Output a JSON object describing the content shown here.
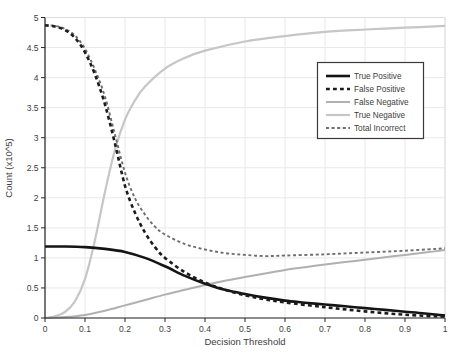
{
  "chart_data": {
    "type": "line",
    "title": "",
    "xlabel": "Decision Threshold",
    "ylabel": "Count (x10^5)",
    "xlim": [
      0,
      1
    ],
    "ylim": [
      0,
      5
    ],
    "x_ticks": [
      "0",
      "0.1",
      "0.2",
      "0.3",
      "0.4",
      "0.5",
      "0.6",
      "0.7",
      "0.8",
      "0.9",
      "1"
    ],
    "y_ticks": [
      "0",
      "0.5",
      "1",
      "1.5",
      "2",
      "2.5",
      "3",
      "3.5",
      "4",
      "4.5",
      "5"
    ],
    "grid": true,
    "legend_position": "upper-right-inset",
    "colors": {
      "axis": "#262626",
      "grid": "#e8e8e8",
      "box_light": "#dedede",
      "legend_border": "#3a3a3a",
      "background": "#ffffff"
    },
    "layout": {
      "plot": {
        "left": 45,
        "right": 445,
        "top": 17.5,
        "bottom": 318
      },
      "legend": {
        "x": 317.5,
        "y": 62.5,
        "width": 106,
        "height": 76,
        "row_start": 76,
        "row_step": 13,
        "sample_x1": 326,
        "sample_x2": 350,
        "label_x": 354
      }
    },
    "series": [
      {
        "name": "True Positive",
        "color": "#141414",
        "width": 2.6,
        "dash": null,
        "z": 4,
        "points": [
          [
            0,
            1.19
          ],
          [
            0.05,
            1.19
          ],
          [
            0.1,
            1.18
          ],
          [
            0.15,
            1.15
          ],
          [
            0.2,
            1.1
          ],
          [
            0.25,
            1.0
          ],
          [
            0.3,
            0.86
          ],
          [
            0.35,
            0.7
          ],
          [
            0.4,
            0.57
          ],
          [
            0.45,
            0.47
          ],
          [
            0.5,
            0.4
          ],
          [
            0.55,
            0.34
          ],
          [
            0.6,
            0.29
          ],
          [
            0.65,
            0.255
          ],
          [
            0.7,
            0.225
          ],
          [
            0.75,
            0.195
          ],
          [
            0.8,
            0.165
          ],
          [
            0.85,
            0.135
          ],
          [
            0.9,
            0.105
          ],
          [
            0.95,
            0.075
          ],
          [
            1,
            0.04
          ]
        ]
      },
      {
        "name": "False Positive",
        "color": "#1c1c1c",
        "width": 2.6,
        "dash": "3.8 3.2",
        "z": 5,
        "points": [
          [
            0,
            4.87
          ],
          [
            0.025,
            4.85
          ],
          [
            0.05,
            4.79
          ],
          [
            0.075,
            4.66
          ],
          [
            0.1,
            4.42
          ],
          [
            0.125,
            4.05
          ],
          [
            0.15,
            3.55
          ],
          [
            0.175,
            2.9
          ],
          [
            0.2,
            2.2
          ],
          [
            0.225,
            1.75
          ],
          [
            0.25,
            1.42
          ],
          [
            0.275,
            1.18
          ],
          [
            0.3,
            1.0
          ],
          [
            0.35,
            0.76
          ],
          [
            0.4,
            0.59
          ],
          [
            0.45,
            0.47
          ],
          [
            0.5,
            0.38
          ],
          [
            0.55,
            0.31
          ],
          [
            0.6,
            0.26
          ],
          [
            0.7,
            0.18
          ],
          [
            0.8,
            0.11
          ],
          [
            0.9,
            0.055
          ],
          [
            1,
            0.02
          ]
        ]
      },
      {
        "name": "False Negative",
        "color": "#b0b0b0",
        "width": 2,
        "dash": null,
        "z": 2,
        "points": [
          [
            0,
            0
          ],
          [
            0.05,
            0.015
          ],
          [
            0.1,
            0.05
          ],
          [
            0.15,
            0.12
          ],
          [
            0.2,
            0.21
          ],
          [
            0.25,
            0.3
          ],
          [
            0.3,
            0.39
          ],
          [
            0.35,
            0.47
          ],
          [
            0.4,
            0.55
          ],
          [
            0.45,
            0.62
          ],
          [
            0.5,
            0.68
          ],
          [
            0.55,
            0.74
          ],
          [
            0.6,
            0.8
          ],
          [
            0.65,
            0.845
          ],
          [
            0.7,
            0.89
          ],
          [
            0.75,
            0.93
          ],
          [
            0.8,
            0.97
          ],
          [
            0.85,
            1.01
          ],
          [
            0.9,
            1.05
          ],
          [
            0.95,
            1.09
          ],
          [
            1,
            1.13
          ]
        ]
      },
      {
        "name": "True Negative",
        "color": "#c6c6c6",
        "width": 2.2,
        "dash": null,
        "z": 1,
        "points": [
          [
            0,
            0
          ],
          [
            0.025,
            0.03
          ],
          [
            0.05,
            0.1
          ],
          [
            0.075,
            0.28
          ],
          [
            0.1,
            0.65
          ],
          [
            0.125,
            1.3
          ],
          [
            0.15,
            2.1
          ],
          [
            0.175,
            2.8
          ],
          [
            0.2,
            3.3
          ],
          [
            0.225,
            3.62
          ],
          [
            0.25,
            3.85
          ],
          [
            0.3,
            4.15
          ],
          [
            0.35,
            4.33
          ],
          [
            0.4,
            4.45
          ],
          [
            0.5,
            4.6
          ],
          [
            0.6,
            4.69
          ],
          [
            0.7,
            4.76
          ],
          [
            0.8,
            4.8
          ],
          [
            0.9,
            4.83
          ],
          [
            1,
            4.86
          ]
        ]
      },
      {
        "name": "Total Incorrect",
        "color": "#6e6e6e",
        "width": 1.9,
        "dash": "3 2.6",
        "z": 3,
        "points": [
          [
            0,
            4.87
          ],
          [
            0.025,
            4.86
          ],
          [
            0.05,
            4.81
          ],
          [
            0.075,
            4.7
          ],
          [
            0.1,
            4.48
          ],
          [
            0.125,
            4.13
          ],
          [
            0.15,
            3.68
          ],
          [
            0.175,
            3.05
          ],
          [
            0.2,
            2.42
          ],
          [
            0.225,
            1.99
          ],
          [
            0.25,
            1.72
          ],
          [
            0.275,
            1.52
          ],
          [
            0.3,
            1.39
          ],
          [
            0.35,
            1.23
          ],
          [
            0.4,
            1.14
          ],
          [
            0.45,
            1.08
          ],
          [
            0.5,
            1.05
          ],
          [
            0.55,
            1.03
          ],
          [
            0.6,
            1.04
          ],
          [
            0.7,
            1.06
          ],
          [
            0.8,
            1.09
          ],
          [
            0.9,
            1.12
          ],
          [
            1,
            1.16
          ]
        ]
      }
    ]
  }
}
